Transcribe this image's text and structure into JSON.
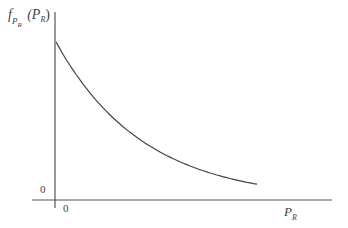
{
  "chart_data": {
    "type": "line",
    "title": "",
    "ylabel": "f_{P_R}(P_R)",
    "xlabel": "P_R",
    "x_origin_label": "0",
    "y_origin_label": "0",
    "grid": false,
    "legend": null,
    "series": [
      {
        "name": "f_{P_R}(P_R)",
        "x": [
          0,
          0.1,
          0.2,
          0.3,
          0.4,
          0.5,
          0.6,
          0.7,
          0.8,
          0.9,
          1.0
        ],
        "values": [
          1.0,
          0.78,
          0.61,
          0.48,
          0.38,
          0.3,
          0.24,
          0.19,
          0.15,
          0.12,
          0.1
        ]
      }
    ]
  },
  "labels": {
    "y_axis_f": "f",
    "y_axis_sub_p": "P",
    "y_axis_sub_r": "R",
    "y_axis_arg_open": "(P",
    "y_axis_arg_r": "R",
    "y_axis_arg_close": ")",
    "x_axis_p": "P",
    "x_axis_r": "R",
    "x_zero": "0",
    "y_zero": "0"
  }
}
